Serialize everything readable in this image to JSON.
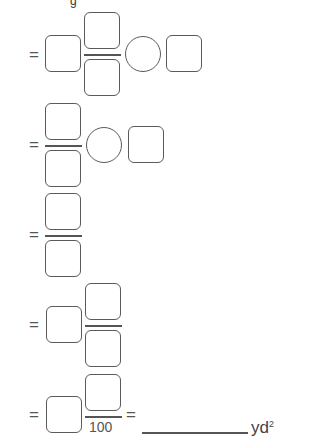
{
  "header_fragment": "g",
  "rows": [
    {
      "equals": "=",
      "label": "row-1: whole number times fraction, operator, box"
    },
    {
      "equals": "=",
      "label": "row-2: fraction, operator, box"
    },
    {
      "equals": "=",
      "label": "row-3: fraction"
    },
    {
      "equals": "=",
      "label": "row-4: mixed number"
    },
    {
      "equals": "=",
      "label": "row-5: mixed number over 100"
    }
  ],
  "row5": {
    "denominator": "100",
    "equals_2": "=",
    "unit": "yd",
    "unit_exponent": "2"
  }
}
